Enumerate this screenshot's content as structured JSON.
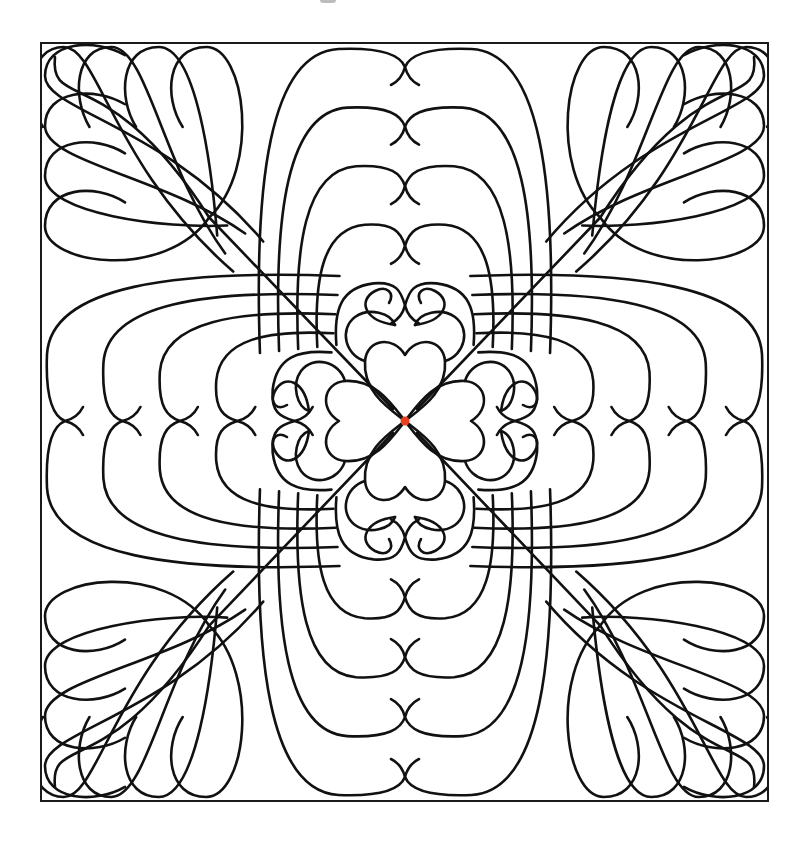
{
  "image": {
    "description": "Quilting line-art pattern: four hearts meeting at center, nested feather arches on each side, feather plumes radiating to each corner",
    "width": 810,
    "height": 844
  },
  "colors": {
    "background": "#ffffff",
    "line": "#111111",
    "center_dot": "#e8401c"
  },
  "frame": {
    "x": 41,
    "y": 43,
    "width": 727,
    "height": 758
  },
  "center": {
    "x": 405,
    "y": 421,
    "dot_radius": 4.5
  },
  "arches": {
    "count": 5,
    "outer_half_width": 150,
    "step": 26,
    "top_start": 46,
    "bottom_end": 300
  },
  "corner_feathers": {
    "petals_per_side": 4
  },
  "hearts": {
    "count": 4
  }
}
